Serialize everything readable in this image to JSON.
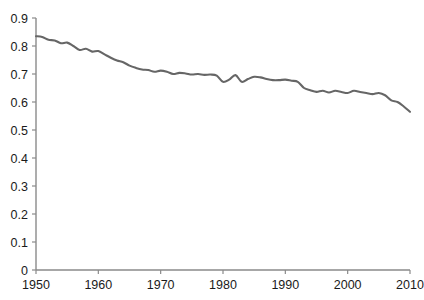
{
  "chart_data": {
    "type": "line",
    "title": "",
    "subtitle": "",
    "xlabel": "",
    "ylabel": "",
    "xlim": [
      1950,
      2010
    ],
    "ylim": [
      0,
      0.9
    ],
    "grid": false,
    "legend": null,
    "x_ticks": [
      "1950",
      "1960",
      "1970",
      "1980",
      "1990",
      "2000",
      "2010"
    ],
    "x_tick_values": [
      1950,
      1960,
      1970,
      1980,
      1990,
      2000,
      2010
    ],
    "y_ticks": [
      "0",
      "0.1",
      "0.2",
      "0.3",
      "0.4",
      "0.5",
      "0.6",
      "0.7",
      "0.8",
      "0.9"
    ],
    "y_tick_values": [
      0,
      0.1,
      0.2,
      0.3,
      0.4,
      0.5,
      0.6,
      0.7,
      0.8,
      0.9
    ],
    "series": [
      {
        "name": "series-1",
        "color": "#666666",
        "x": [
          1950,
          1951,
          1952,
          1953,
          1954,
          1955,
          1956,
          1957,
          1958,
          1959,
          1960,
          1961,
          1962,
          1963,
          1964,
          1965,
          1966,
          1967,
          1968,
          1969,
          1970,
          1971,
          1972,
          1973,
          1974,
          1975,
          1976,
          1977,
          1978,
          1979,
          1980,
          1981,
          1982,
          1983,
          1984,
          1985,
          1986,
          1987,
          1988,
          1989,
          1990,
          1991,
          1992,
          1993,
          1994,
          1995,
          1996,
          1997,
          1998,
          1999,
          2000,
          2001,
          2002,
          2003,
          2004,
          2005,
          2006,
          2007,
          2008,
          2009,
          2010
        ],
        "values": [
          0.835,
          0.832,
          0.822,
          0.82,
          0.81,
          0.812,
          0.8,
          0.786,
          0.79,
          0.78,
          0.782,
          0.77,
          0.758,
          0.748,
          0.742,
          0.73,
          0.722,
          0.716,
          0.714,
          0.708,
          0.712,
          0.708,
          0.7,
          0.704,
          0.702,
          0.698,
          0.7,
          0.697,
          0.698,
          0.694,
          0.672,
          0.68,
          0.696,
          0.672,
          0.682,
          0.69,
          0.688,
          0.682,
          0.678,
          0.678,
          0.68,
          0.676,
          0.672,
          0.65,
          0.642,
          0.636,
          0.64,
          0.634,
          0.64,
          0.636,
          0.632,
          0.64,
          0.636,
          0.632,
          0.628,
          0.632,
          0.624,
          0.606,
          0.6,
          0.584,
          0.565
        ]
      }
    ]
  },
  "style": {
    "axis_color": "#8a8a8a",
    "text_color": "#1a1a1a",
    "background": "#ffffff"
  }
}
